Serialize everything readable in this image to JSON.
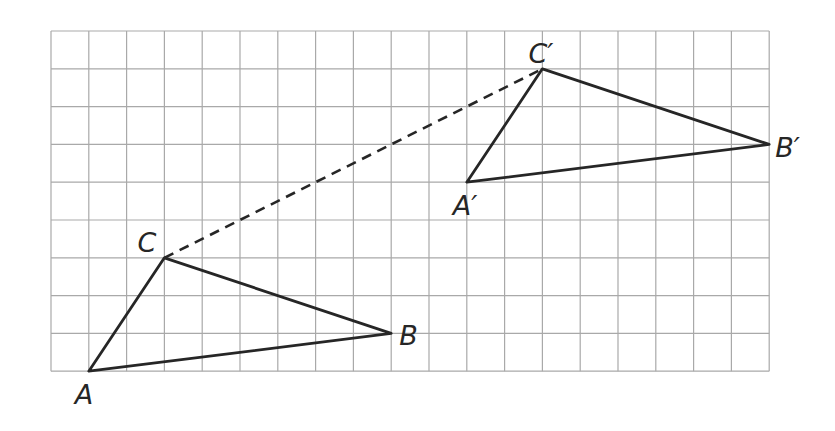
{
  "diagram": {
    "type": "geometric translation on grid",
    "grid": {
      "cols": 19,
      "rows": 9,
      "origin_px": [
        51,
        31
      ],
      "cell_px": 37.8,
      "line_color": "#a9a9a9"
    },
    "stroke_color": "#262626",
    "original": {
      "A": {
        "label": "A",
        "col": 1,
        "row": 9
      },
      "B": {
        "label": "B",
        "col": 9,
        "row": 8
      },
      "C": {
        "label": "C",
        "col": 3,
        "row": 6
      }
    },
    "image": {
      "A": {
        "label": "A′",
        "col": 11,
        "row": 4
      },
      "B": {
        "label": "B′",
        "col": 19,
        "row": 3
      },
      "C": {
        "label": "C′",
        "col": 13,
        "row": 1
      }
    },
    "translation_vector": {
      "from": "C",
      "to": "C′",
      "style": "dashed",
      "dx_cells": 10,
      "dy_cells": -5
    }
  }
}
